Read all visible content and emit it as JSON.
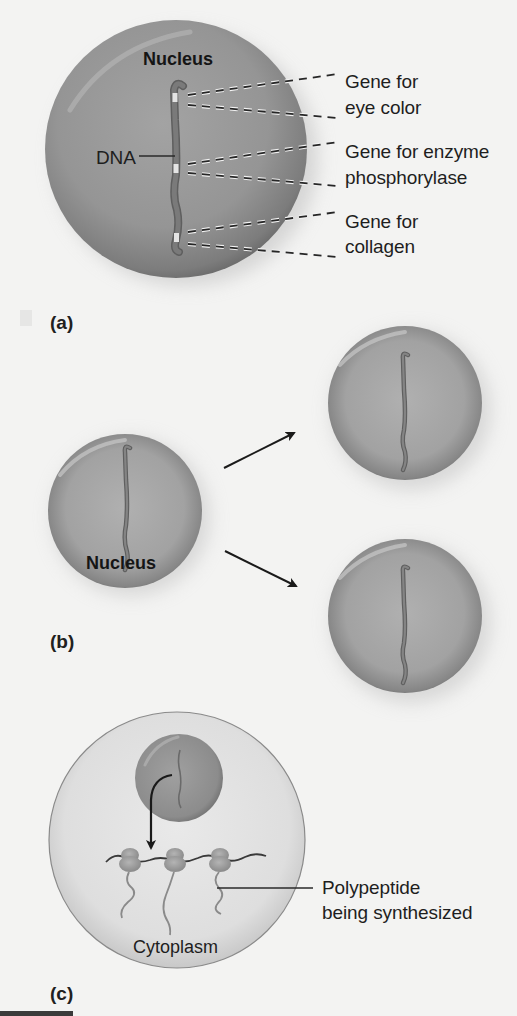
{
  "figure": {
    "panels": [
      {
        "id": "a",
        "label": "(a)",
        "nucleus_label": "Nucleus",
        "dna_label": "DNA",
        "gene_labels": [
          {
            "line1": "Gene for",
            "line2": "eye color"
          },
          {
            "line1": "Gene for enzyme",
            "line2": "phosphorylase"
          },
          {
            "line1": "Gene for",
            "line2": "collagen"
          }
        ]
      },
      {
        "id": "b",
        "label": "(b)",
        "nucleus_label": "Nucleus"
      },
      {
        "id": "c",
        "label": "(c)",
        "cytoplasm_label": "Cytoplasm",
        "polypeptide_label": {
          "line1": "Polypeptide",
          "line2": "being synthesized"
        }
      }
    ],
    "colors": {
      "background": "#f3f3f2",
      "nucleus_fill": "#8e8e8e",
      "nucleus_edge": "#6a6a6a",
      "dna": "#6b6b6b",
      "cell_fill": "#dcdcdc",
      "text": "#1e1e1e"
    }
  }
}
